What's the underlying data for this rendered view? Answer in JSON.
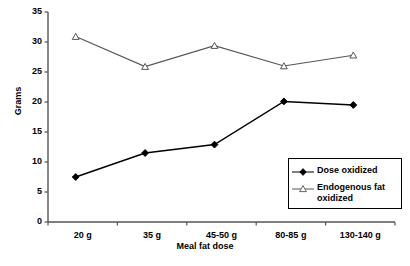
{
  "chart_data": {
    "type": "line",
    "title": "",
    "xlabel": "Meal fat dose",
    "ylabel": "Grams",
    "categories": [
      "20 g",
      "35 g",
      "45-50 g",
      "80-85 g",
      "130-140 g"
    ],
    "ylim": [
      0,
      35
    ],
    "yticks": [
      0,
      5,
      10,
      15,
      20,
      25,
      30,
      35
    ],
    "ytick_labels": [
      "0",
      "5",
      "10",
      "15",
      "20",
      "25",
      "30",
      "35"
    ],
    "grid": false,
    "legend_position": "lower-right-inside",
    "series": [
      {
        "name": "Dose oxidized",
        "marker": "filled-diamond",
        "color": "#000000",
        "values": [
          7.5,
          11.5,
          12.9,
          20.1,
          19.5
        ]
      },
      {
        "name": "Endogenous fat oxidized",
        "marker": "open-triangle",
        "color": "#555555",
        "values": [
          30.9,
          25.9,
          29.4,
          26.0,
          27.8
        ]
      }
    ]
  },
  "legend": {
    "items": [
      {
        "label": "Dose oxidized"
      },
      {
        "label": "Endogenous fat oxidized"
      }
    ]
  },
  "axes": {
    "y_title": "Grams",
    "x_title": "Meal fat dose",
    "y_ticks": [
      "35",
      "30",
      "25",
      "20",
      "15",
      "10",
      "5",
      "0"
    ],
    "x_ticks": [
      "20 g",
      "35 g",
      "45-50 g",
      "80-85 g",
      "130-140 g"
    ]
  }
}
